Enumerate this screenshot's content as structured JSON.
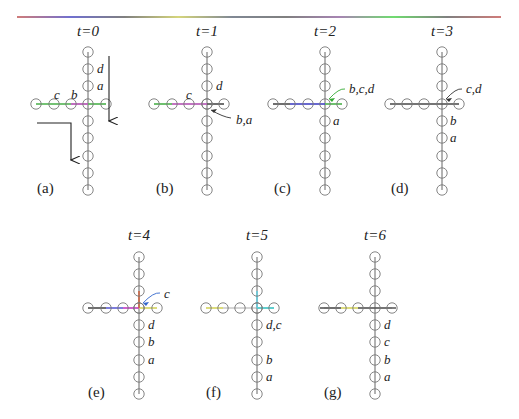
{
  "figure": {
    "top_rule": {
      "x1": 17,
      "x2": 501,
      "y": 17,
      "stops": [
        "#c0504d",
        "#4040c0",
        "#555555",
        "#c8c850",
        "#556070",
        "#555555",
        "#8a5c9a",
        "#40d040",
        "#555555",
        "#c0504d"
      ]
    },
    "panels": [
      {
        "id": "a",
        "label": "(a)",
        "title": "t=0",
        "cx": 88,
        "cy": 104,
        "title_y": 36,
        "label_x": 37,
        "label_y": 193,
        "vertical_ys": [
          52,
          69,
          86,
          104,
          121,
          138,
          156,
          173,
          190
        ],
        "horizontal_xs": [
          36,
          54,
          71,
          88,
          106
        ],
        "h_segments": [
          {
            "x1": 36,
            "x2": 71,
            "color": "#55bb55"
          },
          {
            "x1": 71,
            "x2": 88,
            "color": "#bb55bb"
          },
          {
            "x1": 88,
            "x2": 106,
            "color": "#55bb55"
          }
        ],
        "v_segments": [],
        "node_colors": {
          "h0": "#55aa55",
          "h1": "#55aa55",
          "h2": "#aa55aa",
          "h4": "#55aa55"
        },
        "labels": [
          {
            "text": "d",
            "x": 97,
            "y": 73,
            "color": "#222"
          },
          {
            "text": "a",
            "x": 97,
            "y": 90,
            "color": "#3a8a3a"
          },
          {
            "text": "c",
            "x": 54,
            "y": 99,
            "color": "#222"
          },
          {
            "text": "b",
            "x": 71,
            "y": 99,
            "color": "#222"
          }
        ],
        "arrows": [
          {
            "type": "down",
            "x": 109,
            "y1": 56,
            "y2": 121
          },
          {
            "type": "elbow",
            "x1": 37,
            "y": 123,
            "x2": 71,
            "y2": 160
          }
        ],
        "callout": null
      },
      {
        "id": "b",
        "label": "(b)",
        "title": "t=1",
        "cx": 207,
        "cy": 104,
        "title_y": 36,
        "label_x": 156,
        "label_y": 193,
        "vertical_ys": [
          52,
          69,
          86,
          104,
          121,
          138,
          156,
          173,
          190
        ],
        "horizontal_xs": [
          154,
          172,
          189,
          207,
          224
        ],
        "h_segments": [
          {
            "x1": 154,
            "x2": 172,
            "color": "#55bb55"
          },
          {
            "x1": 172,
            "x2": 207,
            "color": "#bb55bb"
          },
          {
            "x1": 207,
            "x2": 224,
            "color": "#555555"
          }
        ],
        "v_segments": [],
        "node_colors": {
          "h0": "#55aa55",
          "h1": "#cc5555",
          "h2": "#aa55aa",
          "h3": "#bb5599"
        },
        "labels": [
          {
            "text": "d",
            "x": 216,
            "y": 90,
            "color": "#222"
          },
          {
            "text": "c",
            "x": 186,
            "y": 99,
            "color": "#222"
          }
        ],
        "arrows": [],
        "callout": {
          "text": "b,a",
          "tx": 236,
          "ty": 124,
          "from_x": 231,
          "from_y": 118,
          "to_x": 211,
          "to_y": 110,
          "color": "#333"
        }
      },
      {
        "id": "c",
        "label": "(c)",
        "title": "t=2",
        "cx": 325,
        "cy": 104,
        "title_y": 36,
        "label_x": 274,
        "label_y": 193,
        "vertical_ys": [
          52,
          69,
          86,
          104,
          121,
          138,
          156,
          173,
          190
        ],
        "horizontal_xs": [
          273,
          290,
          308,
          325,
          342
        ],
        "h_segments": [
          {
            "x1": 273,
            "x2": 290,
            "color": "#555555"
          },
          {
            "x1": 290,
            "x2": 325,
            "color": "#4444cc"
          },
          {
            "x1": 325,
            "x2": 342,
            "color": "#55bb55"
          }
        ],
        "v_segments": [],
        "node_colors": {
          "h0": "#55aa55",
          "h1": "#4444cc",
          "h2": "#55aa55"
        },
        "labels": [
          {
            "text": "a",
            "x": 333,
            "y": 125,
            "color": "#222"
          }
        ],
        "arrows": [],
        "callout": {
          "text": "b,c,d",
          "tx": 349,
          "ty": 93,
          "from_x": 345,
          "from_y": 89,
          "to_x": 329,
          "to_y": 99,
          "color": "#33aa33"
        }
      },
      {
        "id": "d",
        "label": "(d)",
        "title": "t=3",
        "cx": 442,
        "cy": 104,
        "title_y": 36,
        "label_x": 391,
        "label_y": 193,
        "vertical_ys": [
          52,
          69,
          86,
          104,
          121,
          138,
          156,
          173,
          190
        ],
        "horizontal_xs": [
          390,
          407,
          424,
          442,
          459
        ],
        "h_segments": [
          {
            "x1": 390,
            "x2": 459,
            "color": "#555555"
          }
        ],
        "v_segments": [],
        "node_colors": {
          "h0": "#aa55aa"
        },
        "labels": [
          {
            "text": "b",
            "x": 450,
            "y": 125,
            "color": "#222"
          },
          {
            "text": "a",
            "x": 450,
            "y": 142,
            "color": "#222"
          }
        ],
        "arrows": [],
        "callout": {
          "text": "c,d",
          "tx": 466,
          "ty": 93,
          "from_x": 462,
          "from_y": 89,
          "to_x": 446,
          "to_y": 99,
          "color": "#333"
        }
      },
      {
        "id": "e",
        "label": "(e)",
        "title": "t=4",
        "cx": 139,
        "cy": 308,
        "title_y": 240,
        "label_x": 88,
        "label_y": 397,
        "vertical_ys": [
          257,
          274,
          291,
          308,
          325,
          342,
          360,
          377,
          394
        ],
        "horizontal_xs": [
          88,
          106,
          123,
          139,
          157
        ],
        "h_segments": [
          {
            "x1": 88,
            "x2": 106,
            "color": "#555555"
          },
          {
            "x1": 106,
            "x2": 123,
            "color": "#6666dd"
          },
          {
            "x1": 123,
            "x2": 139,
            "color": "#cc44cc"
          },
          {
            "x1": 139,
            "x2": 157,
            "color": "#dddd66"
          }
        ],
        "v_segments": [
          {
            "y1": 291,
            "y2": 308,
            "color": "#cc6644"
          }
        ],
        "node_colors": {
          "h0": "#44bbcc",
          "h1": "#44bbcc",
          "h2": "#aa44cc",
          "h3": "#cc44aa",
          "h4": "#cccc55",
          "v2": "#cc8844"
        },
        "labels": [
          {
            "text": "d",
            "x": 148,
            "y": 329,
            "color": "#222"
          },
          {
            "text": "b",
            "x": 148,
            "y": 346,
            "color": "#222"
          },
          {
            "text": "a",
            "x": 148,
            "y": 364,
            "color": "#222"
          }
        ],
        "arrows": [],
        "callout": {
          "text": "c",
          "tx": 164,
          "ty": 298,
          "from_x": 160,
          "from_y": 293,
          "to_x": 143,
          "to_y": 303,
          "color": "#3366cc"
        }
      },
      {
        "id": "f",
        "label": "(f)",
        "title": "t=5",
        "cx": 257,
        "cy": 308,
        "title_y": 240,
        "label_x": 206,
        "label_y": 397,
        "vertical_ys": [
          257,
          274,
          291,
          308,
          325,
          342,
          360,
          377,
          394
        ],
        "horizontal_xs": [
          206,
          223,
          240,
          257,
          274
        ],
        "h_segments": [
          {
            "x1": 206,
            "x2": 223,
            "color": "#dddd66"
          },
          {
            "x1": 257,
            "x2": 274,
            "color": "#44cccc"
          }
        ],
        "v_segments": [
          {
            "y1": 291,
            "y2": 308,
            "color": "#66ccdd"
          }
        ],
        "node_colors": {
          "h0": "#cccc55",
          "h3": "#44cccc",
          "v2": "#66bbdd",
          "v8": "#cc5555"
        },
        "labels": [
          {
            "text": "d,c",
            "x": 266,
            "y": 329,
            "color": "#222"
          },
          {
            "text": "b",
            "x": 266,
            "y": 364,
            "color": "#222"
          },
          {
            "text": "a",
            "x": 266,
            "y": 381,
            "color": "#222"
          }
        ],
        "arrows": [],
        "callout": null
      },
      {
        "id": "g",
        "label": "(g)",
        "title": "t=6",
        "cx": 375,
        "cy": 308,
        "title_y": 240,
        "label_x": 324,
        "label_y": 397,
        "vertical_ys": [
          257,
          274,
          291,
          308,
          325,
          342,
          360,
          377,
          394
        ],
        "horizontal_xs": [
          324,
          341,
          358,
          375,
          392
        ],
        "h_segments": [
          {
            "x1": 320,
            "x2": 341,
            "color": "#555555"
          },
          {
            "x1": 341,
            "x2": 358,
            "color": "#dddd66"
          },
          {
            "x1": 358,
            "x2": 396,
            "color": "#555555"
          }
        ],
        "v_segments": [],
        "node_colors": {
          "h1": "#cccc55",
          "h4": "#cccc55"
        },
        "labels": [
          {
            "text": "d",
            "x": 384,
            "y": 329,
            "color": "#222"
          },
          {
            "text": "c",
            "x": 384,
            "y": 346,
            "color": "#222"
          },
          {
            "text": "b",
            "x": 384,
            "y": 364,
            "color": "#222"
          },
          {
            "text": "a",
            "x": 384,
            "y": 381,
            "color": "#222"
          }
        ],
        "arrows": [],
        "callout": null
      }
    ]
  }
}
